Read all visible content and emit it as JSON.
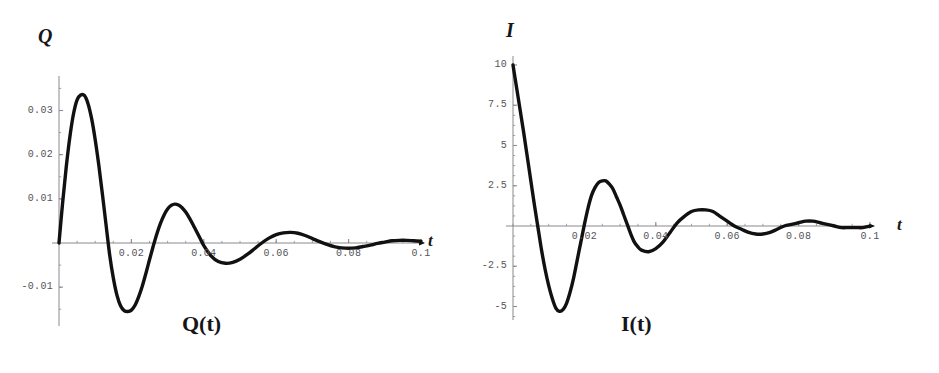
{
  "figure": {
    "background_color": "#ffffff",
    "curve_color": "#111111",
    "axis_color": "#8a8a90",
    "tick_text_color": "#54545a"
  },
  "panels": [
    {
      "id": "left",
      "caption": "Q(t)",
      "y_axis_label": "Q",
      "x_axis_label": "t",
      "x_ticks": [
        "0.02",
        "0.04",
        "0.06",
        "0.08",
        "0.1"
      ],
      "y_ticks": [
        "0.03",
        "0.02",
        "0.01",
        "-0.01"
      ]
    },
    {
      "id": "right",
      "caption": "I(t)",
      "y_axis_label": "I",
      "x_axis_label": "t",
      "x_ticks": [
        "0.02",
        "0.04",
        "0.06",
        "0.08",
        "0.1"
      ],
      "y_ticks": [
        "10",
        "7.5",
        "5",
        "2.5",
        "-2.5",
        "-5"
      ]
    }
  ],
  "chart_data": [
    {
      "type": "line",
      "id": "Q-of-t",
      "title": "Q(t)",
      "xlabel": "t",
      "ylabel": "Q",
      "xlim": [
        0,
        0.1
      ],
      "ylim": [
        -0.018,
        0.036
      ],
      "grid": false,
      "legend": null,
      "xticks": [
        0.02,
        0.04,
        0.06,
        0.08,
        0.1
      ],
      "xticklabels": [
        "0.02",
        "0.04",
        "0.06",
        "0.08",
        "0.1"
      ],
      "yticks": [
        0.03,
        0.02,
        0.01,
        -0.01
      ],
      "yticklabels": [
        "0.03",
        "0.02",
        "0.01",
        "-0.01"
      ],
      "description": "Damped oscillation of charge starting at 0, rising to a first peak of about 0.0335 near t=0.007, then oscillating with decaying amplitude toward 0.",
      "series": [
        {
          "name": "Q",
          "x": [
            0.0,
            0.001,
            0.002,
            0.003,
            0.004,
            0.005,
            0.006,
            0.007,
            0.008,
            0.009,
            0.01,
            0.011,
            0.012,
            0.013,
            0.014,
            0.015,
            0.016,
            0.017,
            0.018,
            0.019,
            0.02,
            0.021,
            0.022,
            0.023,
            0.024,
            0.025,
            0.026,
            0.027,
            0.028,
            0.029,
            0.03,
            0.031,
            0.032,
            0.033,
            0.034,
            0.035,
            0.036,
            0.037,
            0.038,
            0.039,
            0.04,
            0.042,
            0.044,
            0.046,
            0.048,
            0.05,
            0.052,
            0.054,
            0.056,
            0.058,
            0.06,
            0.062,
            0.064,
            0.066,
            0.068,
            0.07,
            0.072,
            0.074,
            0.076,
            0.078,
            0.08,
            0.082,
            0.084,
            0.086,
            0.088,
            0.09,
            0.092,
            0.094,
            0.096,
            0.098,
            0.1
          ],
          "y": [
            0.0,
            0.0091,
            0.0172,
            0.024,
            0.0292,
            0.0324,
            0.0335,
            0.0334,
            0.0316,
            0.0282,
            0.0234,
            0.0176,
            0.011,
            0.0041,
            -0.0027,
            -0.0079,
            -0.0118,
            -0.0142,
            -0.0153,
            -0.0155,
            -0.0152,
            -0.0141,
            -0.0122,
            -0.0098,
            -0.0069,
            -0.0038,
            -0.0008,
            0.002,
            0.0044,
            0.0063,
            0.0077,
            0.0085,
            0.0088,
            0.0086,
            0.008,
            0.007,
            0.0057,
            0.0042,
            0.0026,
            0.001,
            -0.0006,
            -0.0029,
            -0.0042,
            -0.0046,
            -0.0044,
            -0.0037,
            -0.0026,
            -0.0013,
            0.0,
            0.0011,
            0.0019,
            0.0023,
            0.0024,
            0.0022,
            0.0017,
            0.001,
            0.0003,
            -0.0003,
            -0.0008,
            -0.0011,
            -0.0012,
            -0.0011,
            -0.0008,
            -0.0005,
            -0.0001,
            0.0002,
            0.0005,
            0.0006,
            0.0006,
            0.0005,
            0.0004
          ]
        }
      ]
    },
    {
      "type": "line",
      "id": "I-of-t",
      "title": "I(t)",
      "xlabel": "t",
      "ylabel": "I",
      "xlim": [
        0,
        0.1
      ],
      "ylim": [
        -6.0,
        10.5
      ],
      "grid": false,
      "legend": null,
      "xticks": [
        0.02,
        0.04,
        0.06,
        0.08,
        0.1
      ],
      "xticklabels": [
        "0.02",
        "0.04",
        "0.06",
        "0.08",
        "0.1"
      ],
      "yticks": [
        10,
        7.5,
        5,
        2.5,
        -2.5,
        -5
      ],
      "yticklabels": [
        "10",
        "7.5",
        "5",
        "2.5",
        "-2.5",
        "-5"
      ],
      "description": "Damped oscillation of current starting at 10 at t=0, falling steeply through zero near t=0.0065 to a minimum of about -5.3 near t=0.0135, then oscillating with decaying amplitude toward 0.",
      "series": [
        {
          "name": "I",
          "x": [
            0.0,
            0.001,
            0.002,
            0.003,
            0.004,
            0.005,
            0.006,
            0.007,
            0.008,
            0.009,
            0.01,
            0.011,
            0.012,
            0.013,
            0.014,
            0.015,
            0.016,
            0.017,
            0.018,
            0.019,
            0.02,
            0.021,
            0.022,
            0.023,
            0.024,
            0.025,
            0.026,
            0.027,
            0.028,
            0.029,
            0.03,
            0.031,
            0.032,
            0.033,
            0.034,
            0.035,
            0.036,
            0.038,
            0.04,
            0.042,
            0.044,
            0.046,
            0.048,
            0.05,
            0.052,
            0.054,
            0.056,
            0.058,
            0.06,
            0.062,
            0.064,
            0.066,
            0.068,
            0.07,
            0.072,
            0.074,
            0.076,
            0.078,
            0.08,
            0.082,
            0.084,
            0.086,
            0.088,
            0.09,
            0.092,
            0.094,
            0.096,
            0.098,
            0.1
          ],
          "y": [
            10.0,
            8.6,
            7.2,
            5.8,
            4.3,
            2.8,
            1.3,
            -0.1,
            -1.5,
            -2.7,
            -3.7,
            -4.5,
            -5.1,
            -5.3,
            -5.2,
            -4.8,
            -4.1,
            -3.2,
            -2.1,
            -1.0,
            0.1,
            1.1,
            1.9,
            2.4,
            2.7,
            2.8,
            2.8,
            2.6,
            2.3,
            1.8,
            1.3,
            0.7,
            0.1,
            -0.5,
            -1.0,
            -1.3,
            -1.5,
            -1.6,
            -1.4,
            -1.0,
            -0.4,
            0.2,
            0.6,
            0.9,
            1.0,
            1.0,
            0.9,
            0.6,
            0.3,
            0.0,
            -0.2,
            -0.4,
            -0.5,
            -0.5,
            -0.4,
            -0.2,
            0.0,
            0.1,
            0.2,
            0.3,
            0.3,
            0.2,
            0.1,
            0.0,
            -0.1,
            -0.1,
            -0.1,
            -0.1,
            0.0
          ]
        }
      ]
    }
  ]
}
